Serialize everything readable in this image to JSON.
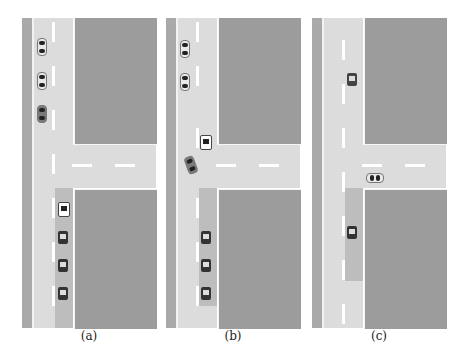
{
  "figure": {
    "panels": [
      {
        "label": "(a)",
        "description": "Vehicles queued on main road; platoon of trucks in right lane approaching intersection"
      },
      {
        "label": "(b)",
        "description": "Lead truck at intersection, car turning into adjacent lane"
      },
      {
        "label": "(c)",
        "description": "Single car upstream, car on cross street, single truck in shaded lane"
      }
    ],
    "colors": {
      "road": "#dcdcdc",
      "block": "#9c9c9c",
      "shaded_lane": "#bdbdbd",
      "lane_marking": "#ffffff",
      "shoulder": "#a9a9a9"
    }
  }
}
